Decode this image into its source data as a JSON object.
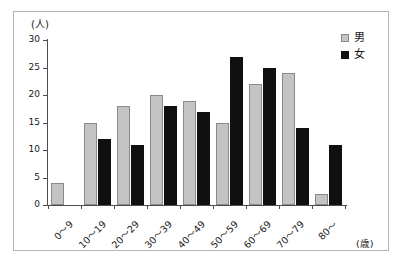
{
  "chart_data": {
    "type": "bar",
    "title": "",
    "subtitle": "",
    "xlabel": "(歳)",
    "ylabel": "(人)",
    "categories": [
      "0〜9",
      "10〜19",
      "20〜29",
      "30〜39",
      "40〜49",
      "50〜59",
      "60〜69",
      "70〜79",
      "80〜"
    ],
    "series": [
      {
        "name": "男",
        "color": "#c4c4c4",
        "values": [
          4,
          15,
          18,
          20,
          19,
          15,
          22,
          24,
          2
        ]
      },
      {
        "name": "女",
        "color": "#101010",
        "values": [
          0,
          12,
          11,
          18,
          17,
          27,
          25,
          14,
          11
        ]
      }
    ],
    "ylim": [
      0,
      30
    ],
    "y_ticks": [
      0,
      5,
      10,
      15,
      20,
      25,
      30
    ],
    "y_tick_labels": [
      "0",
      "5",
      "10",
      "15",
      "20",
      "25",
      "30"
    ],
    "grid": false,
    "legend_position": "top-right"
  },
  "legend": {
    "entries": [
      {
        "label": "男",
        "swatch": "male"
      },
      {
        "label": "女",
        "swatch": "female"
      }
    ]
  },
  "axes": {
    "y_unit": "(人)",
    "x_unit": "(歳)"
  }
}
